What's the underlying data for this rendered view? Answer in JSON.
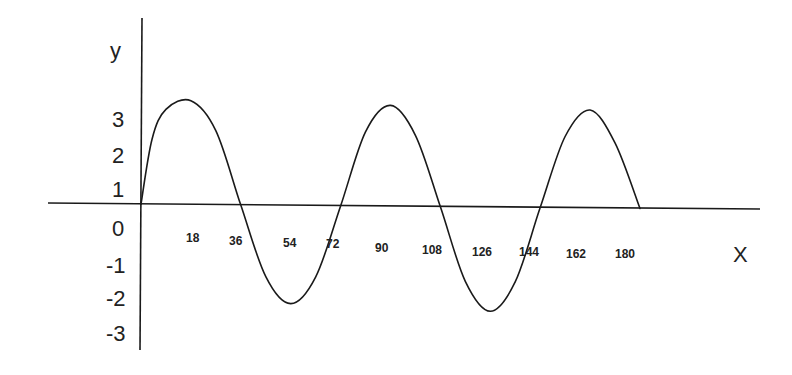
{
  "chart_data": {
    "type": "line",
    "title": "",
    "xlabel": "X",
    "ylabel": "y",
    "grid": false,
    "legend": null,
    "x_tick_labels": [
      "18",
      "36",
      "54",
      "72",
      "90",
      "108",
      "126",
      "144",
      "162",
      "180"
    ],
    "y_tick_labels": [
      "3",
      "2",
      "1",
      "0",
      "-1",
      "-2",
      "-3"
    ],
    "xlim": [
      0,
      200
    ],
    "ylim": [
      -3.5,
      3.5
    ],
    "series": [
      {
        "name": "wave",
        "x": [
          0,
          4,
          9,
          18,
          27,
          36,
          45,
          54,
          63,
          72,
          81,
          90,
          99,
          108,
          117,
          126,
          135,
          144,
          153,
          162,
          171,
          180
        ],
        "y": [
          0,
          2.2,
          3.2,
          3.5,
          2.5,
          0,
          -2.4,
          -3.3,
          -2.4,
          0,
          2.5,
          3.4,
          2.4,
          0,
          -2.5,
          -3.5,
          -2.5,
          0,
          2.4,
          3.3,
          2.2,
          0
        ]
      }
    ],
    "annotations": []
  },
  "labels": {
    "y_axis_name": "y",
    "x_axis_name": "X"
  }
}
